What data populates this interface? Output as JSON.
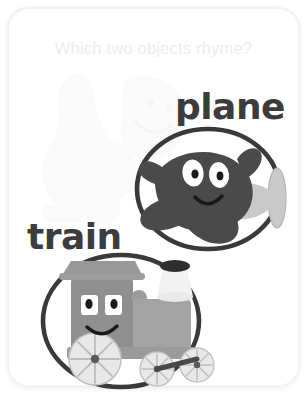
{
  "card": {
    "prompt": "Which two objects rhyme?",
    "background_color": "#ffffff",
    "border_color": "#f2f2f2",
    "prompt_color": "#ededed"
  },
  "items": [
    {
      "id": "plane",
      "label": "plane",
      "label_color": "#3c3c3c",
      "illustration": "cartoon-airplane-with-face",
      "body_color": "#4a4a4a",
      "ring_color": "#3a3a3a",
      "accent_color": "#c9c9c9",
      "eye_color": "#ffffff",
      "pupil_color": "#1a1a1a"
    },
    {
      "id": "train",
      "label": "train",
      "label_color": "#3c3c3c",
      "illustration": "cartoon-locomotive-with-face",
      "body_color": "#8f8f8f",
      "cab_color": "#a3a3a3",
      "roof_color": "#989898",
      "ring_color": "#3a3a3a",
      "wheel_color": "#e8e8e8",
      "wheel_stroke": "#b0b0b0",
      "stack_color": "#f2f2f2",
      "stack_top_color": "#2e2e2e",
      "eye_color": "#ffffff",
      "pupil_color": "#1a1a1a"
    }
  ],
  "ghost": {
    "description": "faded dinosaur watermark",
    "color": "#cfcfcf",
    "opacity": "0.085"
  }
}
